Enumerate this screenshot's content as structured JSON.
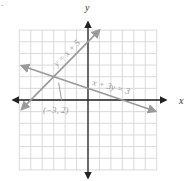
{
  "problem_marker": ".",
  "chart_data": {
    "type": "line",
    "title": "",
    "xlabel": "x",
    "ylabel": "y",
    "xlim": [
      -6,
      6
    ],
    "ylim": [
      -6,
      6
    ],
    "grid": true,
    "grid_step": 1,
    "axis_arrows": true,
    "series": [
      {
        "name": "y = x + 5",
        "label": "y = x + 5",
        "equation": "y = x + 5",
        "x": [
          -5.8,
          1.0
        ],
        "y": [
          -0.8,
          6.0
        ],
        "color": "#9a9a9a",
        "arrows": "both"
      },
      {
        "name": "x + 3y = 3",
        "label": "x + 3y = 3",
        "equation": "x + 3y = 3",
        "x": [
          -5.8,
          5.9
        ],
        "y": [
          2.93,
          -0.97
        ],
        "color": "#9a9a9a",
        "arrows": "both"
      }
    ],
    "annotations": [
      {
        "text": "(−3, 2)",
        "point": [
          -3,
          2
        ],
        "description": "intersection point with pointer"
      }
    ]
  },
  "colors": {
    "axis": "#222222",
    "grid": "#d9d9d9",
    "lines": "#9a9a9a",
    "text": "#9a9a9a",
    "axis_label": "#333333"
  }
}
